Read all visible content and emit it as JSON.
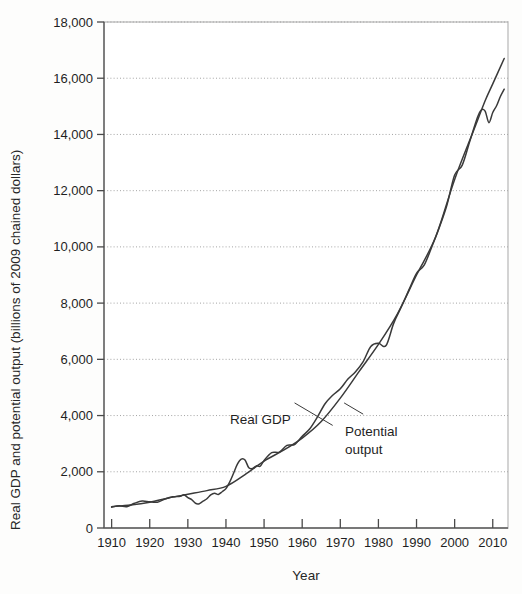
{
  "figure": {
    "background_color": "#fdfdfc",
    "plot_background_color": "#ffffff",
    "frame_color": "#c9c9c9",
    "line_color": "#3a3a3a",
    "grid_color": "#9a9a9a"
  },
  "labels": {
    "y_axis_title": "Real GDP and potential output (billions of 2009 chained dollars)",
    "x_axis_title": "Year",
    "annotation_real_gdp": "Real GDP",
    "annotation_potential_1": "Potential",
    "annotation_potential_2": "output"
  },
  "chart_data": {
    "type": "line",
    "title": "",
    "subtitle": "",
    "xlabel": "Year",
    "ylabel": "Real GDP and potential output (billions of 2009 chained dollars)",
    "xlim": [
      1908,
      2014
    ],
    "ylim": [
      0,
      18000
    ],
    "grid": true,
    "grid_axis": "y",
    "legend_position": "inline-annotations",
    "x_ticks": [
      1910,
      1920,
      1930,
      1940,
      1950,
      1960,
      1970,
      1980,
      1990,
      2000,
      2010
    ],
    "x_tick_labels": [
      "1910",
      "1920",
      "1930",
      "1940",
      "1950",
      "1960",
      "1970",
      "1980",
      "1990",
      "2000",
      "2010"
    ],
    "y_ticks": [
      0,
      2000,
      4000,
      6000,
      8000,
      10000,
      12000,
      14000,
      16000,
      18000
    ],
    "y_tick_labels": [
      "0",
      "2,000",
      "4,000",
      "6,000",
      "8,000",
      "10,000",
      "12,000",
      "14,000",
      "16,000",
      "18,000"
    ],
    "annotations": [
      {
        "text": "Real GDP",
        "x": 1958,
        "y": 4450,
        "points_to_x": 1968,
        "points_to_y": 3650
      },
      {
        "text": "Potential output",
        "x": 1976,
        "y": 4050,
        "points_to_x": 1971,
        "points_to_y": 4450
      }
    ],
    "series": [
      {
        "name": "Real GDP",
        "x": [
          1910,
          1912,
          1914,
          1916,
          1918,
          1920,
          1922,
          1924,
          1926,
          1928,
          1929,
          1930,
          1931,
          1932,
          1933,
          1934,
          1935,
          1936,
          1937,
          1938,
          1939,
          1940,
          1941,
          1942,
          1943,
          1944,
          1945,
          1946,
          1947,
          1948,
          1949,
          1950,
          1952,
          1954,
          1956,
          1958,
          1960,
          1962,
          1964,
          1966,
          1968,
          1970,
          1972,
          1974,
          1976,
          1978,
          1980,
          1982,
          1984,
          1986,
          1988,
          1990,
          1992,
          1994,
          1996,
          1998,
          2000,
          2002,
          2004,
          2006,
          2007,
          2008,
          2009,
          2010,
          2011,
          2012,
          2013
        ],
        "values": [
          740,
          790,
          760,
          880,
          960,
          930,
          920,
          1030,
          1110,
          1130,
          1180,
          1080,
          1010,
          880,
          865,
          955,
          1040,
          1180,
          1240,
          1195,
          1290,
          1400,
          1640,
          1950,
          2270,
          2450,
          2420,
          2140,
          2120,
          2210,
          2200,
          2400,
          2680,
          2700,
          2940,
          2970,
          3260,
          3530,
          3950,
          4420,
          4720,
          4950,
          5300,
          5560,
          5920,
          6460,
          6570,
          6490,
          7280,
          7860,
          8470,
          9060,
          9350,
          10000,
          10700,
          11500,
          12560,
          12910,
          13770,
          14610,
          14870,
          14830,
          14420,
          14780,
          15020,
          15350,
          15610
        ]
      },
      {
        "name": "Potential output",
        "x": [
          1910,
          1915,
          1920,
          1925,
          1930,
          1935,
          1940,
          1945,
          1950,
          1955,
          1960,
          1965,
          1970,
          1975,
          1980,
          1985,
          1990,
          1995,
          2000,
          2005,
          2008,
          2010,
          2013
        ],
        "values": [
          760,
          820,
          920,
          1070,
          1200,
          1330,
          1480,
          1900,
          2380,
          2760,
          3200,
          3790,
          4620,
          5580,
          6530,
          7620,
          9000,
          10350,
          12400,
          14150,
          15200,
          15800,
          16700
        ]
      }
    ]
  }
}
